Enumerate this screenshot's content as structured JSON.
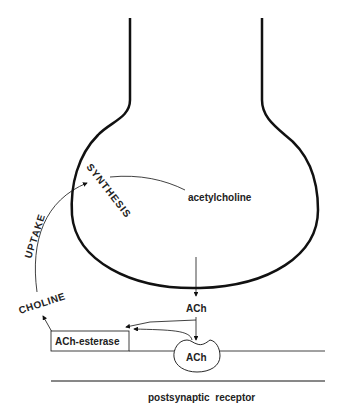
{
  "diagram": {
    "labels": {
      "synthesis": "SYNTHESIS",
      "acetylcholine": "acetylcholine",
      "uptake": "UPTAKE",
      "choline": "CHOLINE",
      "ach_released": "ACh",
      "ach_esterase": "ACh-esterase",
      "ach_bound": "ACh",
      "postsynaptic_receptor": "postsynaptic  receptor"
    },
    "colors": {
      "stroke": "#111111",
      "text": "#222222",
      "background": "#ffffff"
    }
  }
}
